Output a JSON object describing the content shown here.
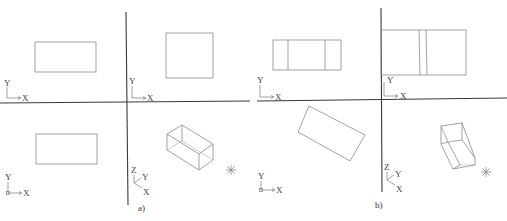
{
  "figure": {
    "panels": [
      {
        "id": "a",
        "caption": "a)",
        "viewports": [
          {
            "position": "top-left",
            "view": "front",
            "content": "rectangle",
            "ucs": {
              "x": "X",
              "y": "Y"
            }
          },
          {
            "position": "top-right",
            "view": "side",
            "content": "square",
            "ucs": {
              "x": "X",
              "y": "Y"
            }
          },
          {
            "position": "bottom-left",
            "view": "top",
            "content": "rectangle",
            "ucs": {
              "x": "X",
              "y": "Y"
            }
          },
          {
            "position": "bottom-right",
            "view": "isometric",
            "content": "wireframe box",
            "ucs": {
              "x": "X",
              "y": "Y",
              "z": "Z"
            }
          }
        ]
      },
      {
        "id": "b",
        "caption": "b)",
        "viewports": [
          {
            "position": "top-left",
            "view": "front",
            "content": "rectangle with two vertical edges",
            "ucs": {
              "x": "X",
              "y": "Y"
            }
          },
          {
            "position": "top-right",
            "view": "side",
            "content": "rectangle with two close vertical edges",
            "ucs": {
              "x": "X",
              "y": "Y"
            }
          },
          {
            "position": "bottom-left",
            "view": "top",
            "content": "rotated rectangle",
            "ucs": {
              "x": "X",
              "y": "Y"
            }
          },
          {
            "position": "bottom-right",
            "view": "isometric",
            "content": "rotated wireframe box",
            "ucs": {
              "x": "X",
              "y": "Y",
              "z": "Z"
            }
          }
        ]
      }
    ],
    "labels": {
      "x": "X",
      "y": "Y",
      "z": "Z",
      "caption_a": "a)",
      "caption_b": "b)"
    }
  }
}
